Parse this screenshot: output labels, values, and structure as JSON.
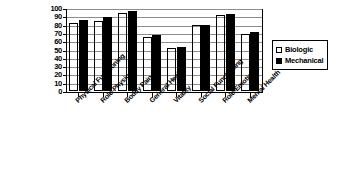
{
  "chart_data": {
    "type": "bar",
    "title": "",
    "subtitle": "",
    "xlabel": "",
    "ylabel": "",
    "ylim": [
      0,
      100
    ],
    "yticks": [
      0,
      10,
      20,
      30,
      40,
      50,
      60,
      70,
      80,
      90,
      100
    ],
    "grid": true,
    "legend_position": "right",
    "categories": [
      "Physical Functioning",
      "Role-Physical",
      "Bodily Pain",
      "General Health",
      "Vitality",
      "Social Functioning",
      "Role-Emotional",
      "Mental Health"
    ],
    "series": [
      {
        "name": "Biologic",
        "color": "#ffffff",
        "values": [
          82,
          84,
          94,
          65,
          52,
          79,
          91,
          69
        ]
      },
      {
        "name": "Mechanical",
        "color": "#000000",
        "values": [
          85,
          89,
          96,
          67,
          53,
          80,
          93,
          71
        ]
      }
    ]
  },
  "legend": {
    "items": [
      {
        "label": "Biologic",
        "swatch": "hollow-square-icon"
      },
      {
        "label": "Mechanical",
        "swatch": "filled-square-icon"
      }
    ]
  }
}
